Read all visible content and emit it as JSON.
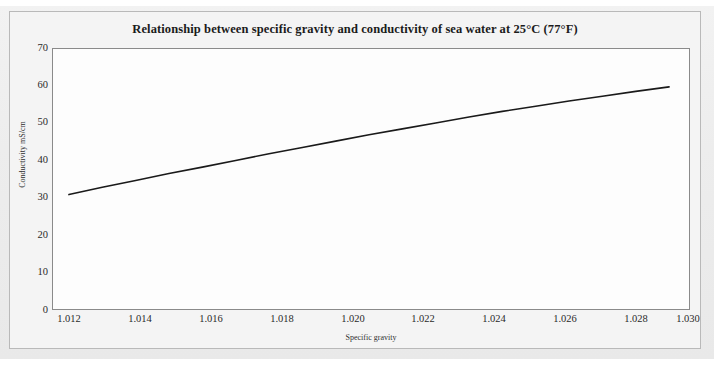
{
  "figure": {
    "title": "Relationship between specific gravity and conductivity of sea water at 25°C (77°F)",
    "frame_color": "#b9b9b9",
    "plot_bg": "#fdfdfd",
    "axis_color": "#8a8a8a",
    "curve_color": "#1a1a1a"
  },
  "axes": {
    "y_title": "Conductivity mS/cm",
    "x_title": "Specific gravity",
    "y_ticks": [
      "0",
      "10",
      "20",
      "30",
      "40",
      "50",
      "60",
      "70"
    ],
    "x_ticks": [
      "1.012",
      "1.014",
      "1.016",
      "1.018",
      "1.020",
      "1.022",
      "1.024",
      "1.026",
      "1.028",
      "1.030"
    ]
  },
  "chart_data": {
    "type": "line",
    "title": "Relationship between specific gravity and conductivity of sea water at 25°C (77°F)",
    "xlabel": "Specific gravity",
    "ylabel": "Conductivity mS/cm",
    "xlim": [
      1.012,
      1.03
    ],
    "ylim": [
      0,
      70
    ],
    "xticks": [
      1.012,
      1.014,
      1.016,
      1.018,
      1.02,
      1.022,
      1.024,
      1.026,
      1.028,
      1.03
    ],
    "yticks": [
      0,
      10,
      20,
      30,
      40,
      50,
      60,
      70
    ],
    "grid": false,
    "legend": false,
    "series": [
      {
        "name": "Conductivity vs specific gravity",
        "x": [
          1.012,
          1.013,
          1.014,
          1.015,
          1.016,
          1.017,
          1.018,
          1.019,
          1.02,
          1.021,
          1.022,
          1.023,
          1.024,
          1.025,
          1.026,
          1.027,
          1.028,
          1.029,
          1.03
        ],
        "y": [
          30.8,
          32.8,
          34.6,
          36.5,
          38.2,
          40.0,
          41.8,
          43.5,
          45.2,
          46.9,
          48.5,
          50.1,
          51.7,
          53.2,
          54.6,
          56.0,
          57.3,
          58.6,
          59.8
        ]
      }
    ]
  }
}
